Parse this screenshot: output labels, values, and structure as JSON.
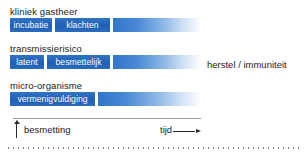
{
  "figure": {
    "rows": [
      {
        "label": "kliniek gastheer",
        "segments": [
          {
            "label": "incubatie",
            "left": 0,
            "width": 42,
            "style": "solid"
          },
          {
            "label": "klachten",
            "left": 45,
            "width": 55,
            "style": "solid"
          },
          {
            "label": "",
            "left": 103,
            "width": 88,
            "style": "fade"
          }
        ]
      },
      {
        "label": "transmissierisico",
        "segments": [
          {
            "label": "latent",
            "left": 0,
            "width": 34,
            "style": "solid"
          },
          {
            "label": "besmettelijk",
            "left": 37,
            "width": 63,
            "style": "solid"
          },
          {
            "label": "",
            "left": 103,
            "width": 88,
            "style": "fade"
          }
        ]
      },
      {
        "label": "micro-organisme",
        "segments": [
          {
            "label": "vermenigvuldiging",
            "left": 0,
            "width": 85,
            "style": "solid"
          },
          {
            "label": "",
            "left": 88,
            "width": 103,
            "style": "fade"
          }
        ]
      }
    ],
    "side_caption": "herstel / immuniteit",
    "axis": {
      "start_label": "besmetting",
      "end_label": "tijd",
      "start_arrow_icon": "arrow-up-icon",
      "end_arrow_icon": "arrow-right-icon"
    },
    "colors": {
      "bar_blue": "#2060b4",
      "bar_blue_light": "#2f76c9",
      "text": "#1c1c1c",
      "segment_text": "#ffffff",
      "axis_line": "#9a9a9a",
      "dotted_rule": "#7d7d7d",
      "background": "#ffffff"
    }
  }
}
